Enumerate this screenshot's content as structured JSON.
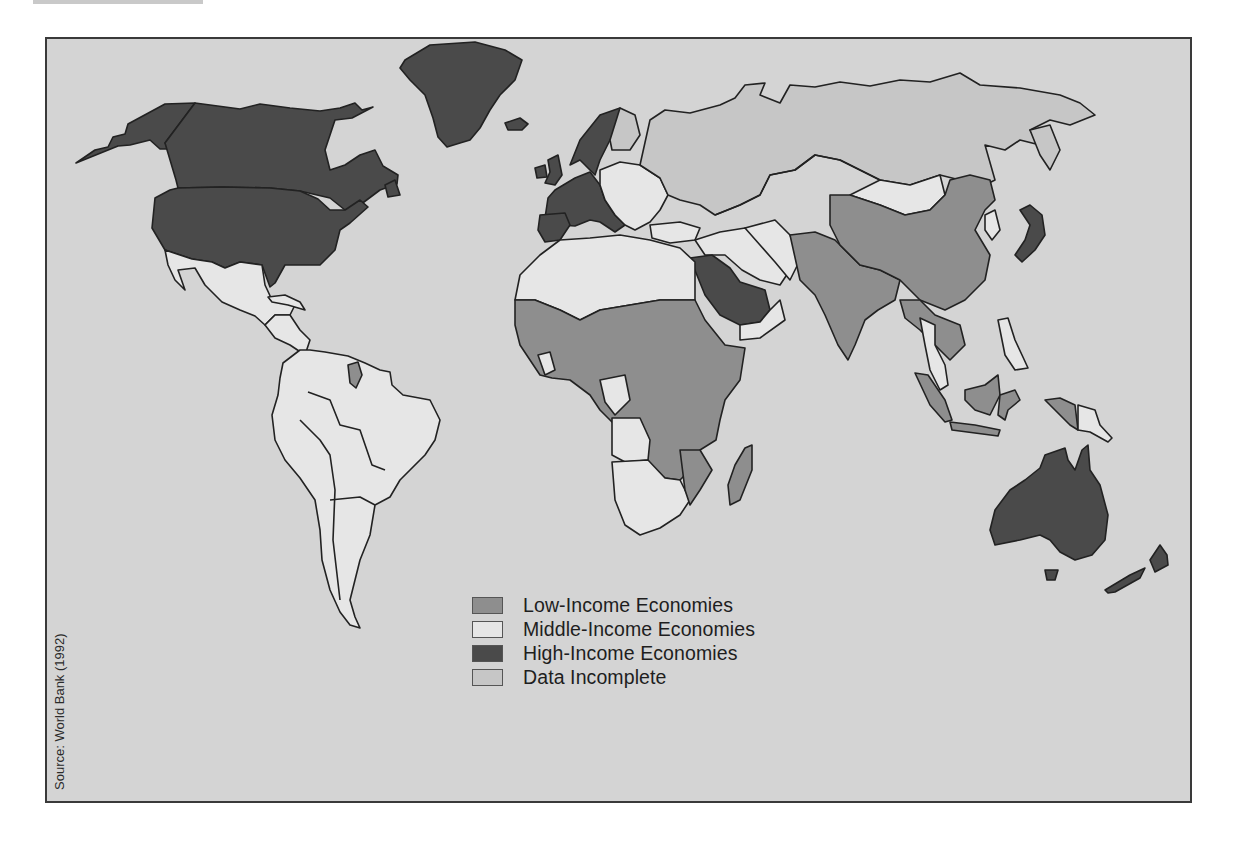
{
  "map": {
    "source": "Source: World Bank (1992)",
    "colors": {
      "ocean": "#d4d4d4",
      "low": "#8e8e8e",
      "middle": "#e6e6e6",
      "high": "#4a4a4a",
      "incomplete": "#c6c6c6",
      "border": "#222222"
    },
    "legend": [
      {
        "key": "low",
        "label": "Low-Income Economies",
        "color": "#8e8e8e"
      },
      {
        "key": "middle",
        "label": "Middle-Income Economies",
        "color": "#e6e6e6"
      },
      {
        "key": "high",
        "label": "High-Income Economies",
        "color": "#4a4a4a"
      },
      {
        "key": "incomplete",
        "label": "Data Incomplete",
        "color": "#c6c6c6"
      }
    ],
    "regions": {
      "high_income": [
        "United States",
        "Canada",
        "Greenland",
        "Iceland",
        "Western Europe",
        "Scandinavia",
        "Japan",
        "Saudi Arabia",
        "Australia",
        "New Zealand"
      ],
      "middle_income": [
        "Mexico",
        "Central America",
        "South America",
        "North Africa",
        "Southern Africa",
        "Eastern Europe",
        "Middle East",
        "Mongolia",
        "Southeast Asia (partial)",
        "Papua New Guinea"
      ],
      "low_income": [
        "Sub-Saharan Africa",
        "South Asia",
        "China",
        "Guyana",
        "Indonesia",
        "Madagascar",
        "Indochina (partial)"
      ],
      "data_incomplete": [
        "Soviet Union / Russia",
        "Central Asia",
        "North Korea"
      ]
    }
  }
}
